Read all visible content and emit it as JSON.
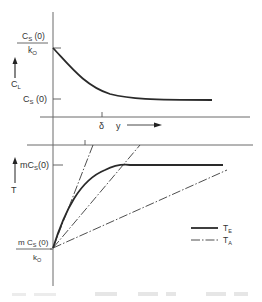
{
  "figure": {
    "top_panel": {
      "y_axis_label": "C",
      "y_axis_label_sub": "L",
      "y_tick_upper_num_main": "C",
      "y_tick_upper_num_sub": "S",
      "y_tick_upper_num_tail": " (0)",
      "y_tick_upper_den_main": "k",
      "y_tick_upper_den_sub": "O",
      "y_tick_lower_main": "C",
      "y_tick_lower_sub": "S",
      "y_tick_lower_tail": " (0)",
      "x_tick_label": "δ",
      "x_axis_label": "y"
    },
    "bottom_panel": {
      "y_axis_label": "T",
      "y_tick_upper_pre": "mC",
      "y_tick_upper_sub": "S",
      "y_tick_upper_tail": "(0)",
      "y_tick_lower_num_pre": "m C",
      "y_tick_lower_num_sub": "S",
      "y_tick_lower_num_tail": " (0)",
      "y_tick_lower_den_main": "k",
      "y_tick_lower_den_sub": "O"
    },
    "legend": [
      {
        "main": "T",
        "sub": "E",
        "style": "solid"
      },
      {
        "main": "T",
        "sub": "A",
        "style": "dash-dot"
      }
    ]
  }
}
